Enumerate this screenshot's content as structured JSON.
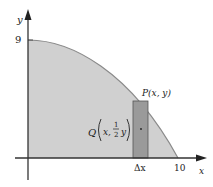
{
  "diagram": {
    "axes": {
      "x_label": "x",
      "y_label": "y",
      "y_tick_label": "9",
      "x_tick_label": "10"
    },
    "curve": {
      "y_intercept": 9,
      "x_intercept": 10,
      "fill_color": "#d0d0d0",
      "stroke_color": "#8a8a8a"
    },
    "strip": {
      "width_label": "Δx",
      "fill_color": "#9a9a9a",
      "stroke_color": "#555555"
    },
    "point_p": {
      "label": "P(x, y)"
    },
    "point_q": {
      "prefix": "Q",
      "x": "x,",
      "frac_num": "1",
      "frac_den": "2",
      "y": "y"
    }
  }
}
